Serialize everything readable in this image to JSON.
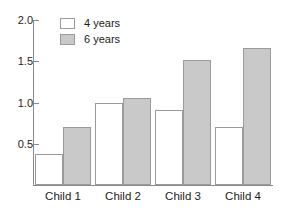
{
  "chart_data": {
    "type": "bar",
    "title": "",
    "xlabel": "",
    "ylabel": "",
    "categories": [
      "Child 1",
      "Child 2",
      "Child 3",
      "Child 4"
    ],
    "series": [
      {
        "name": "4 years",
        "color": "#ffffff",
        "values": [
          0.37,
          1.0,
          0.91,
          0.7
        ]
      },
      {
        "name": "6  years",
        "color": "#c9c9c9",
        "values": [
          0.7,
          1.06,
          1.51,
          1.66
        ]
      }
    ],
    "ylim": [
      0,
      2.0
    ],
    "yticks": [
      0.5,
      1.0,
      1.5,
      2.0
    ],
    "ytick_labels": [
      "0.5",
      "1.0",
      "1.5",
      "2.0"
    ],
    "grid": false,
    "legend_position": "top-left",
    "axis_color": "#8a8a8a",
    "bar_edge_color": "#9a9a9a",
    "text_color": "#1c1c1c"
  }
}
